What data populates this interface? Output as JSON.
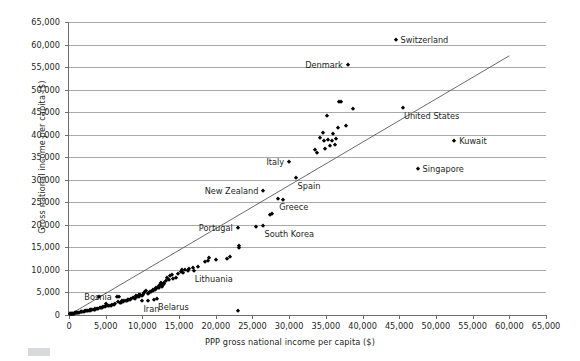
{
  "chart_data": {
    "type": "scatter",
    "title": "",
    "xlabel": "PPP gross national income per capita ($)",
    "ylabel": "Gross national income per capita ($)",
    "xlim": [
      0,
      65000
    ],
    "ylim": [
      0,
      65000
    ],
    "xticks": [
      0,
      5000,
      10000,
      15000,
      20000,
      25000,
      30000,
      35000,
      40000,
      45000,
      50000,
      55000,
      60000,
      65000
    ],
    "xticklabels": [
      "0",
      "5,000",
      "10,000",
      "15,000",
      "20,000",
      "25,000",
      "30,000",
      "35,000",
      "40,000",
      "45,000",
      "50,000",
      "55,000",
      "60,000",
      "65,000"
    ],
    "yticks": [
      0,
      5000,
      10000,
      15000,
      20000,
      25000,
      30000,
      35000,
      40000,
      45000,
      50000,
      55000,
      60000,
      65000
    ],
    "yticklabels": [
      "0",
      "5,000",
      "10,000",
      "15,000",
      "20,000",
      "25,000",
      "30,000",
      "35,000",
      "40,000",
      "45,000",
      "50,000",
      "55,000",
      "60,000",
      "65,000"
    ],
    "grid": "horizontal",
    "legend": "none",
    "reference_line": {
      "label": "diagonal reference line",
      "x": [
        0,
        60000
      ],
      "y": [
        0,
        57500
      ]
    },
    "annotations": [
      {
        "label": "Switzerland",
        "x": 44500,
        "y": 61000,
        "anchor": "right"
      },
      {
        "label": "Denmark",
        "x": 38000,
        "y": 55500,
        "anchor": "left"
      },
      {
        "label": "United States",
        "x": 45500,
        "y": 46000,
        "anchor": "right-below"
      },
      {
        "label": "Kuwait",
        "x": 52500,
        "y": 38500,
        "anchor": "right"
      },
      {
        "label": "Singapore",
        "x": 47500,
        "y": 32500,
        "anchor": "right"
      },
      {
        "label": "Italy",
        "x": 30000,
        "y": 34000,
        "anchor": "left"
      },
      {
        "label": "Spain",
        "x": 31000,
        "y": 30500,
        "anchor": "right-below"
      },
      {
        "label": "New Zealand",
        "x": 26500,
        "y": 27500,
        "anchor": "left"
      },
      {
        "label": "Greece",
        "x": 28500,
        "y": 25800,
        "anchor": "right-below"
      },
      {
        "label": "South Korea",
        "x": 26500,
        "y": 19800,
        "anchor": "right-below"
      },
      {
        "label": "Portugal",
        "x": 23000,
        "y": 19300,
        "anchor": "left"
      },
      {
        "label": "Lithuania",
        "x": 17000,
        "y": 9800,
        "anchor": "right-below"
      },
      {
        "label": "Belarus",
        "x": 12000,
        "y": 3600,
        "anchor": "right-below"
      },
      {
        "label": "Iran",
        "x": 10000,
        "y": 3000,
        "anchor": "right-below"
      },
      {
        "label": "Bosnia",
        "x": 6500,
        "y": 4000,
        "anchor": "left"
      }
    ],
    "points": [
      [
        44500,
        61000
      ],
      [
        38000,
        55500
      ],
      [
        45500,
        46000
      ],
      [
        52500,
        38500
      ],
      [
        47500,
        32500
      ],
      [
        36800,
        47200
      ],
      [
        37100,
        47300
      ],
      [
        38700,
        45700
      ],
      [
        35100,
        44200
      ],
      [
        36600,
        41400
      ],
      [
        37800,
        42000
      ],
      [
        34600,
        40300
      ],
      [
        36000,
        40200
      ],
      [
        35800,
        38600
      ],
      [
        34800,
        38500
      ],
      [
        35300,
        38800
      ],
      [
        34200,
        39200
      ],
      [
        36400,
        39100
      ],
      [
        33500,
        36600
      ],
      [
        30000,
        34000
      ],
      [
        31000,
        30500
      ],
      [
        26500,
        27500
      ],
      [
        28500,
        25800
      ],
      [
        29200,
        25500
      ],
      [
        27400,
        22100
      ],
      [
        27600,
        22400
      ],
      [
        26500,
        19800
      ],
      [
        25500,
        19600
      ],
      [
        23000,
        19300
      ],
      [
        23200,
        14900
      ],
      [
        23100,
        15400
      ],
      [
        21900,
        12900
      ],
      [
        19100,
        12700
      ],
      [
        18500,
        11800
      ],
      [
        17000,
        9800
      ],
      [
        16400,
        10100
      ],
      [
        15800,
        9900
      ],
      [
        15200,
        9600
      ],
      [
        15400,
        10000
      ],
      [
        14600,
        8300
      ],
      [
        14200,
        8000
      ],
      [
        13800,
        8600
      ],
      [
        13400,
        8100
      ],
      [
        13000,
        6900
      ],
      [
        12900,
        7200
      ],
      [
        12600,
        7100
      ],
      [
        12800,
        6600
      ],
      [
        12400,
        6700
      ],
      [
        12200,
        6400
      ],
      [
        12100,
        6000
      ],
      [
        11900,
        5800
      ],
      [
        11700,
        5600
      ],
      [
        11500,
        5300
      ],
      [
        11400,
        5500
      ],
      [
        11200,
        5000
      ],
      [
        11000,
        5200
      ],
      [
        10900,
        4900
      ],
      [
        10700,
        4600
      ],
      [
        10500,
        5400
      ],
      [
        10400,
        5100
      ],
      [
        10200,
        4800
      ],
      [
        10000,
        3000
      ],
      [
        10100,
        4400
      ],
      [
        9900,
        4200
      ],
      [
        9700,
        4500
      ],
      [
        9500,
        4000
      ],
      [
        9300,
        3900
      ],
      [
        9100,
        4300
      ],
      [
        8900,
        3700
      ],
      [
        8700,
        3800
      ],
      [
        8500,
        3500
      ],
      [
        8300,
        3300
      ],
      [
        8100,
        3400
      ],
      [
        7900,
        3100
      ],
      [
        7700,
        3000
      ],
      [
        7500,
        3200
      ],
      [
        7300,
        2900
      ],
      [
        7100,
        2700
      ],
      [
        6900,
        2600
      ],
      [
        6700,
        2800
      ],
      [
        6500,
        4000
      ],
      [
        6300,
        2400
      ],
      [
        6100,
        2300
      ],
      [
        5900,
        2200
      ],
      [
        5700,
        2100
      ],
      [
        5500,
        2000
      ],
      [
        5300,
        1900
      ],
      [
        5100,
        2500
      ],
      [
        4900,
        1800
      ],
      [
        4700,
        1700
      ],
      [
        4500,
        1600
      ],
      [
        4300,
        1500
      ],
      [
        4100,
        4000
      ],
      [
        4000,
        1400
      ],
      [
        3800,
        1300
      ],
      [
        3600,
        1200
      ],
      [
        3400,
        1150
      ],
      [
        3200,
        1100
      ],
      [
        3000,
        1050
      ],
      [
        2800,
        950
      ],
      [
        2600,
        900
      ],
      [
        2400,
        850
      ],
      [
        2200,
        800
      ],
      [
        2000,
        700
      ],
      [
        1800,
        650
      ],
      [
        1600,
        600
      ],
      [
        1400,
        550
      ],
      [
        1200,
        500
      ],
      [
        1000,
        430
      ],
      [
        900,
        400
      ],
      [
        800,
        350
      ],
      [
        700,
        300
      ],
      [
        600,
        280
      ],
      [
        500,
        250
      ],
      [
        400,
        220
      ],
      [
        350,
        200
      ],
      [
        300,
        180
      ],
      [
        250,
        160
      ],
      [
        200,
        140
      ],
      [
        150,
        120
      ],
      [
        12700,
        6200
      ],
      [
        12300,
        5900
      ],
      [
        11800,
        6100
      ],
      [
        13200,
        7500
      ],
      [
        14000,
        8800
      ],
      [
        16900,
        10400
      ],
      [
        18900,
        11900
      ],
      [
        20000,
        12200
      ],
      [
        21500,
        12500
      ],
      [
        23000,
        900
      ],
      [
        12000,
        3600
      ],
      [
        11600,
        3400
      ],
      [
        10800,
        3200
      ],
      [
        5000,
        1950
      ],
      [
        4200,
        1450
      ],
      [
        3500,
        1250
      ],
      [
        2900,
        1000
      ],
      [
        2300,
        780
      ],
      [
        1700,
        620
      ],
      [
        1100,
        470
      ],
      [
        13600,
        7800
      ],
      [
        14800,
        9000
      ],
      [
        15600,
        9400
      ],
      [
        16200,
        9700
      ],
      [
        17600,
        10600
      ],
      [
        6800,
        4100
      ],
      [
        7200,
        3050
      ],
      [
        8000,
        3250
      ],
      [
        9000,
        3650
      ],
      [
        9600,
        4350
      ],
      [
        36200,
        37800
      ],
      [
        35500,
        37400
      ],
      [
        34900,
        36900
      ],
      [
        33800,
        35900
      ]
    ]
  }
}
